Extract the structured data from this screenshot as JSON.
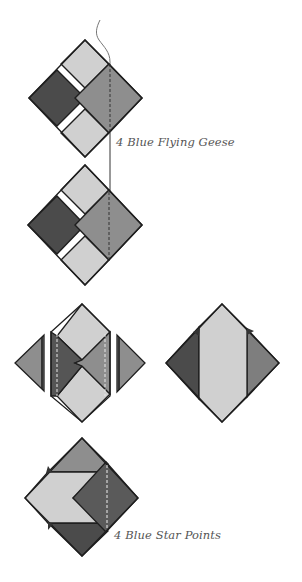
{
  "colors": {
    "dark": "#4b4b4b",
    "medium": "#8e8e8e",
    "light": "#d0d0d0",
    "outline": "#1e1e1e",
    "thread": "#777777",
    "background": "#ffffff"
  },
  "labels": {
    "flying_geese": "4 Blue Flying Geese",
    "star_points": "4 Blue Star Points"
  },
  "diagram": {
    "steps": [
      {
        "id": "step-1",
        "description": "Square-in-a-square unit with dark left square, medium right square, light top and bottom; stitching line on right"
      },
      {
        "id": "step-2",
        "description": "Same unit with thread continuing; dashed stitch line on right square"
      },
      {
        "id": "step-3",
        "description": "Unit trimmed with side triangles added left and right; alternate light-center diamond unit"
      },
      {
        "id": "step-4",
        "description": "Pressed unit showing light chevron with medium and dark triangles"
      }
    ]
  }
}
